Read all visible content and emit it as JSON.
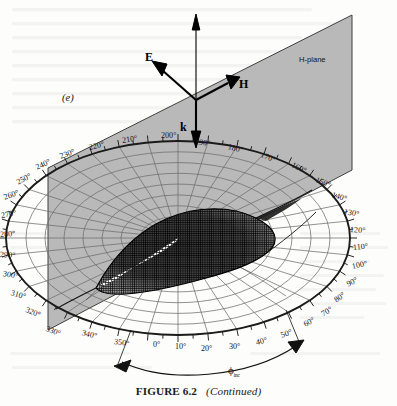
{
  "figure": {
    "caption_label": "FIGURE 6.2",
    "caption_note": "(Continued)",
    "panel_letter": "(e)",
    "plane_label": "H-plane",
    "axis_angle_label": "ϕ",
    "axis_angle_subscript": "inc"
  },
  "vectors": [
    {
      "name": "E-field-vector",
      "label": "E"
    },
    {
      "name": "H-field-vector",
      "label": "H"
    },
    {
      "name": "k-propagation-vector",
      "label": "k"
    }
  ],
  "colors": {
    "page_background": "#fdfdfb",
    "plane_fill": "#b9b9b9",
    "plane_edge": "#3a3a3a",
    "grid_line": "#6e6e6e",
    "rim_line": "#1b1b1b",
    "lobe_mesh": "#141414",
    "text": "#16161a"
  },
  "chart_data": {
    "type": "polar-3d-surface",
    "xlabel": "ϕinc",
    "ylabel": "",
    "grid": true,
    "legend": "none",
    "azimuth_unit": "degrees",
    "azimuth_tick_step": 10,
    "azimuth_range": [
      0,
      350
    ],
    "azimuth_labels": [
      "0°",
      "10°",
      "20°",
      "30°",
      "40°",
      "50°",
      "60°",
      "70°",
      "80°",
      "90°",
      "100°",
      "110°",
      "120°",
      "130°",
      "140°",
      "150°",
      "160°",
      "170°",
      "180°",
      "190°",
      "200°",
      "210°",
      "220°",
      "230°",
      "240°",
      "250°",
      "260°",
      "270°",
      "280°",
      "290°",
      "300°",
      "310°",
      "320°",
      "330°",
      "340°",
      "350°"
    ],
    "radial_rings": 9,
    "annotations": [
      "(e)",
      "H-plane",
      "E",
      "H",
      "k",
      "ϕinc"
    ]
  },
  "angle_ticks": [
    {
      "label": "0°",
      "x": 153,
      "y": 340,
      "rot": 0
    },
    {
      "label": "10°",
      "x": 175,
      "y": 342,
      "rot": 0
    },
    {
      "label": "20°",
      "x": 201,
      "y": 344,
      "rot": 0
    },
    {
      "label": "30°",
      "x": 229,
      "y": 342,
      "rot": 0
    },
    {
      "label": "40°",
      "x": 256,
      "y": 338,
      "rot": -13
    },
    {
      "label": "50°",
      "x": 281,
      "y": 331,
      "rot": -20
    },
    {
      "label": "60°",
      "x": 304,
      "y": 320,
      "rot": -27
    },
    {
      "label": "70°",
      "x": 322,
      "y": 310,
      "rot": -32
    },
    {
      "label": "80°",
      "x": 335,
      "y": 296,
      "rot": -36
    },
    {
      "label": "90°",
      "x": 347,
      "y": 280,
      "rot": -27
    },
    {
      "label": "100°",
      "x": 352,
      "y": 262,
      "rot": -12
    },
    {
      "label": "110°",
      "x": 353,
      "y": 243,
      "rot": -6
    },
    {
      "label": "120°",
      "x": 350,
      "y": 225,
      "rot": 4
    },
    {
      "label": "130°",
      "x": 344,
      "y": 207,
      "rot": 10
    },
    {
      "label": "140°",
      "x": 332,
      "y": 190,
      "rot": 17
    },
    {
      "label": "150°",
      "x": 316,
      "y": 175,
      "rot": 22
    },
    {
      "label": "160°",
      "x": 292,
      "y": 160,
      "rot": 25
    },
    {
      "label": "170°",
      "x": 261,
      "y": 150,
      "rot": 22
    },
    {
      "label": "180°",
      "x": 228,
      "y": 142,
      "rot": 14
    },
    {
      "label": "190°",
      "x": 195,
      "y": 137,
      "rot": 8
    },
    {
      "label": "200°",
      "x": 161,
      "y": 131,
      "rot": 0
    },
    {
      "label": "210°",
      "x": 122,
      "y": 136,
      "rot": -9
    },
    {
      "label": "220°",
      "x": 89,
      "y": 143,
      "rot": -14
    },
    {
      "label": "230°",
      "x": 60,
      "y": 152,
      "rot": -20
    },
    {
      "label": "240°",
      "x": 36,
      "y": 163,
      "rot": -24
    },
    {
      "label": "250°",
      "x": 17,
      "y": 178,
      "rot": -28
    },
    {
      "label": "260°",
      "x": 4,
      "y": 193,
      "rot": -20
    },
    {
      "label": "270°",
      "x": 1,
      "y": 211,
      "rot": -10
    },
    {
      "label": "280°",
      "x": 0,
      "y": 230,
      "rot": -4
    },
    {
      "label": "290°",
      "x": 0,
      "y": 250,
      "rot": 4
    },
    {
      "label": "300°",
      "x": 3,
      "y": 269,
      "rot": 10
    },
    {
      "label": "310°",
      "x": 11,
      "y": 288,
      "rot": 16
    },
    {
      "label": "320°",
      "x": 26,
      "y": 305,
      "rot": 22
    },
    {
      "label": "330°",
      "x": 46,
      "y": 324,
      "rot": 20
    },
    {
      "label": "340°",
      "x": 82,
      "y": 328,
      "rot": 14
    },
    {
      "label": "350°",
      "x": 114,
      "y": 337,
      "rot": 8
    }
  ]
}
